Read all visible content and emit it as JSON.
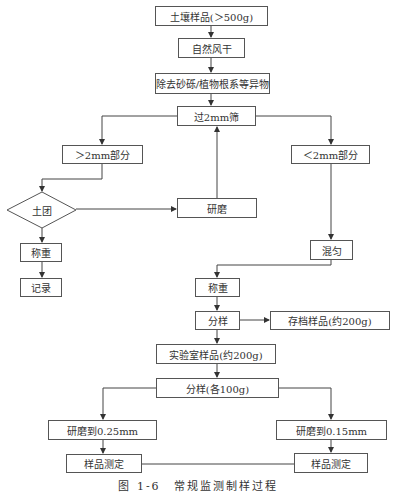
{
  "nodes": {
    "soil_sample": "土壤样品(＞500g)",
    "air_dry": "自然风干",
    "remove_debris": "除去砂砾/植物根系等异物",
    "sieve_2mm": "过2mm筛",
    "gt_2mm": "＞2mm部分",
    "lt_2mm": "＜2mm部分",
    "clod_decision": "土团",
    "grind": "研磨",
    "weigh_left": "称重",
    "record": "记录",
    "mix": "混匀",
    "weigh_mid": "称重",
    "subsample": "分样",
    "archive_sample": "存档样品(约200g)",
    "lab_sample": "实验室样品(约200g)",
    "subsample_each": "分样(各100g)",
    "grind_025": "研磨到0.25mm",
    "grind_015": "研磨到0.15mm",
    "measure_left": "样品测定",
    "measure_right": "样品测定"
  },
  "caption": "图 1-6　常规监测制样过程"
}
